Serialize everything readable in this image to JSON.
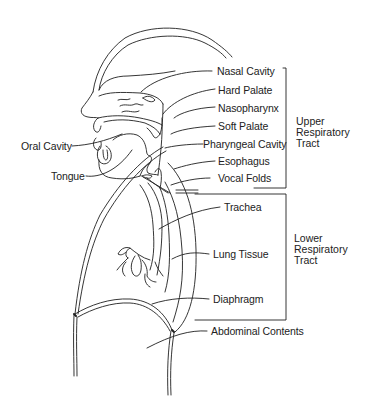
{
  "diagram": {
    "title": "",
    "line_color": "#1f1f1f",
    "text_color": "#222222",
    "labels": {
      "nasal_cavity": "Nasal Cavity",
      "hard_palate": "Hard Palate",
      "nasopharynx": "Nasopharynx",
      "soft_palate": "Soft Palate",
      "pharyngeal_cavity": "Pharyngeal Cavity",
      "esophagus": "Esophagus",
      "vocal_folds": "Vocal Folds",
      "oral_cavity": "Oral Cavity",
      "tongue": "Tongue",
      "trachea": "Trachea",
      "lung_tissue": "Lung Tissue",
      "diaphragm": "Diaphragm",
      "abdominal_contents": "Abdominal Contents"
    },
    "groups": {
      "upper": "Upper\nRespiratory\nTract",
      "lower": "Lower\nRespiratory\nTract"
    }
  }
}
